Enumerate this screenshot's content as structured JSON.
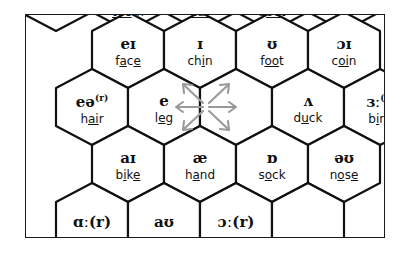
{
  "diagram": {
    "frame_color": "#1a1a1a",
    "cell_border_color": "#111111",
    "background": "#ffffff",
    "arrow_color": "#9a9a9a",
    "arrow_icon_name": "six-direction-arrow-star"
  },
  "rows": [
    {
      "id": "row-top-clipped",
      "clipped": "top",
      "cells": [
        {
          "symbol": "",
          "word": "teeth",
          "underline": "ee"
        },
        {
          "symbol": "",
          "word": "ear",
          "underline": "ea"
        },
        {
          "symbol": "",
          "word": "boot",
          "underline": "oo"
        }
      ]
    },
    {
      "id": "row-1",
      "clipped": "none",
      "cells": [
        {
          "symbol": "eɪ",
          "superscript": "",
          "word": "face",
          "underline": "a_e"
        },
        {
          "symbol": "ɪ",
          "superscript": "",
          "word": "chin",
          "underline": "i"
        },
        {
          "symbol": "ʊ",
          "superscript": "",
          "word": "foot",
          "underline": "oo"
        },
        {
          "symbol": "ɔɪ",
          "superscript": "",
          "word": "coin",
          "underline": "oi"
        }
      ]
    },
    {
      "id": "row-2",
      "clipped": "none",
      "cells": [
        {
          "symbol": "eə",
          "superscript": "(r)",
          "word": "hair",
          "underline": "ai"
        },
        {
          "symbol": "e",
          "superscript": "",
          "word": "leg",
          "underline": "e"
        },
        {
          "symbol": "",
          "superscript": "",
          "word": "",
          "icon": "six-direction-arrow-star"
        },
        {
          "symbol": "ʌ",
          "superscript": "",
          "word": "duck",
          "underline": "u"
        },
        {
          "symbol": "ɜː",
          "superscript": "(r)",
          "word": "bird",
          "underline": "i"
        }
      ]
    },
    {
      "id": "row-3",
      "clipped": "none",
      "cells": [
        {
          "symbol": "aɪ",
          "superscript": "",
          "word": "bike",
          "underline": "i_e"
        },
        {
          "symbol": "æ",
          "superscript": "",
          "word": "hand",
          "underline": "a"
        },
        {
          "symbol": "ɒ",
          "superscript": "",
          "word": "sock",
          "underline": "o"
        },
        {
          "symbol": "əʊ",
          "superscript": "",
          "word": "nose",
          "underline": "o_e"
        }
      ]
    },
    {
      "id": "row-bottom-clipped",
      "clipped": "bottom",
      "cells": [
        {
          "symbol": "ɑː",
          "superscript": "(r)",
          "word": ""
        },
        {
          "symbol": "aʊ",
          "superscript": "",
          "word": ""
        },
        {
          "symbol": "ɔː",
          "superscript": "(r)",
          "word": ""
        }
      ]
    }
  ],
  "labels": {
    "teeth": "teeth",
    "ear": "ear",
    "boot": "boot",
    "face": "face",
    "chin": "chin",
    "foot": "foot",
    "coin": "coin",
    "hair": "hair",
    "leg": "leg",
    "duck": "duck",
    "bird": "bird",
    "bike": "bike",
    "hand": "hand",
    "sock": "sock",
    "nose": "nose"
  },
  "symbols": {
    "face": "eɪ",
    "chin": "ɪ",
    "foot": "ʊ",
    "coin": "ɔɪ",
    "hair": "eə",
    "leg": "e",
    "duck": "ʌ",
    "bird": "ɜː",
    "bike": "aɪ",
    "hand": "æ",
    "sock": "ɒ",
    "nose": "əʊ",
    "car": "ɑː",
    "mouth": "aʊ",
    "door": "ɔː",
    "rhotic_marker": "(r)"
  }
}
